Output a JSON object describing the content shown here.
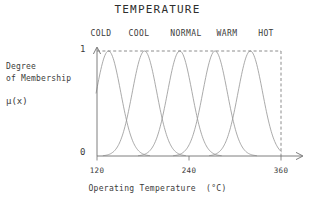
{
  "chart_data": {
    "type": "line",
    "title": "TEMPERATURE",
    "xlabel": "Operating Temperature  (°C)",
    "ylabel_lines": [
      "Degree",
      "of Membership"
    ],
    "ylabel_symbol": "μ(x)",
    "xlim": [
      120,
      360
    ],
    "ylim": [
      0,
      1
    ],
    "xticks": [
      120,
      240,
      360
    ],
    "xticklabels": [
      "120",
      "240",
      "360"
    ],
    "yticks": [
      0,
      1
    ],
    "yticklabels": [
      "0",
      "1"
    ],
    "grid": false,
    "legend_position": "above-plot-inline",
    "line_color": "#8a8a8a",
    "axis_color": "#6f6f6f",
    "text_color": "#3b3b3b",
    "background": "#ffffff",
    "annotations": {
      "top_dashed_line_at_y": 1,
      "right_dashed_line_at_x": 360
    },
    "series": [
      {
        "name": "COLD",
        "shape": "gaussian",
        "center": 135,
        "sigma": 16,
        "peak": 1
      },
      {
        "name": "COOL",
        "shape": "gaussian",
        "center": 182,
        "sigma": 16,
        "peak": 1
      },
      {
        "name": "NORMAL",
        "shape": "gaussian",
        "center": 228,
        "sigma": 16,
        "peak": 1
      },
      {
        "name": "WARM",
        "shape": "gaussian",
        "center": 274,
        "sigma": 16,
        "peak": 1
      },
      {
        "name": "HOT",
        "shape": "gaussian",
        "center": 320,
        "sigma": 16,
        "peak": 1
      }
    ],
    "category_labels": [
      "COLD",
      "COOL",
      "NORMAL",
      "WARM",
      "HOT"
    ]
  }
}
